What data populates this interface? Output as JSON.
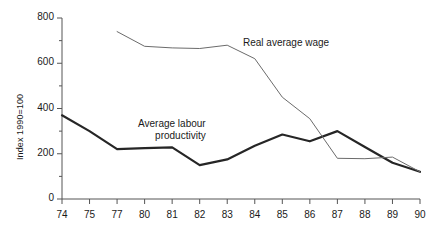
{
  "chart_data": {
    "type": "line",
    "title": "",
    "xlabel": "",
    "ylabel": "Index 1990=100",
    "categories": [
      "74",
      "75",
      "77",
      "80",
      "81",
      "82",
      "83",
      "84",
      "85",
      "86",
      "87",
      "88",
      "89",
      "90"
    ],
    "ylim": [
      0,
      800
    ],
    "yticks": [
      0,
      200,
      400,
      600,
      800
    ],
    "yticks_minor": [
      100,
      300,
      500,
      700
    ],
    "grid": false,
    "legend": "inline annotations",
    "series": [
      {
        "name": "Average labour productivity",
        "style": "thick",
        "values": [
          370,
          300,
          220,
          225,
          228,
          150,
          175,
          235,
          285,
          255,
          300,
          230,
          160,
          120
        ]
      },
      {
        "name": "Real average wage",
        "style": "thin",
        "values": [
          null,
          null,
          740,
          675,
          668,
          665,
          680,
          620,
          450,
          355,
          180,
          178,
          185,
          120
        ]
      }
    ],
    "annotations": [
      {
        "text": "Real average wage",
        "x": "85",
        "y": 700
      },
      {
        "text_line1": "Average labour",
        "text_line2": "productivity",
        "x": "82",
        "y": 330
      }
    ]
  },
  "colors": {
    "axis": "#555555",
    "thick_line": "#262626",
    "thin_line": "#6b6b6b",
    "text": "#1a1a1a",
    "background": "#ffffff"
  }
}
